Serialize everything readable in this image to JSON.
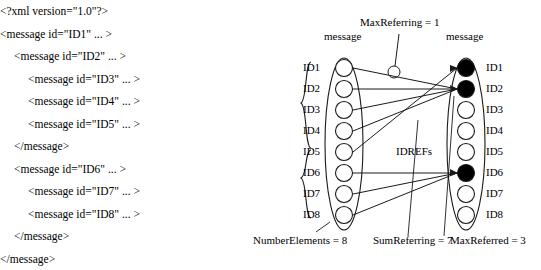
{
  "xml_lines": [
    {
      "indent": 0,
      "text": "<?xml version=\"1.0\"?>"
    },
    {
      "indent": 0,
      "text": "<message id=\"ID1\" ... >"
    },
    {
      "indent": 1,
      "text": "<message id=\"ID2\" ... >"
    },
    {
      "indent": 2,
      "text": "<message id=\"ID3\" ... >"
    },
    {
      "indent": 2,
      "text": "<message id=\"ID4\" ... >"
    },
    {
      "indent": 2,
      "text": "<message id=\"ID5\" ... >"
    },
    {
      "indent": 1,
      "text": "</message>"
    },
    {
      "indent": 1,
      "text": "<message id=\"ID6\" ... >"
    },
    {
      "indent": 2,
      "text": "<message id=\"ID7\" ... >"
    },
    {
      "indent": 2,
      "text": "<message id=\"ID8\" ... >"
    },
    {
      "indent": 1,
      "text": "</message>"
    },
    {
      "indent": 0,
      "text": "</message>"
    }
  ],
  "diagram": {
    "left_column_title": "message",
    "right_column_title": "message",
    "max_referring_label": "MaxReferring = 1",
    "idrefs_label": "IDREFs",
    "number_elements_label": "NumberElements = 8",
    "sum_referring_label": "SumReferring = 7",
    "max_referred_label": "MaxReferred = 3",
    "left_ids": [
      "ID1",
      "ID2",
      "ID3",
      "ID4",
      "ID5",
      "ID6",
      "ID7",
      "ID8"
    ],
    "right_ids": [
      "ID1",
      "ID2",
      "ID3",
      "ID4",
      "ID5",
      "ID6",
      "ID7",
      "ID8"
    ],
    "filled_right_nodes": [
      1,
      2,
      6
    ],
    "edges": [
      {
        "from": 1,
        "to": 2
      },
      {
        "from": 2,
        "to": 2
      },
      {
        "from": 3,
        "to": 2
      },
      {
        "from": 4,
        "to": 2
      },
      {
        "from": 5,
        "to": 1
      },
      {
        "from": 6,
        "to": 6
      },
      {
        "from": 7,
        "to": 6
      },
      {
        "from": 8,
        "to": 6
      }
    ],
    "colors": {
      "stroke": "#1a1a1a",
      "node_fill": "#ffffff",
      "filled_node": "#000000"
    }
  }
}
